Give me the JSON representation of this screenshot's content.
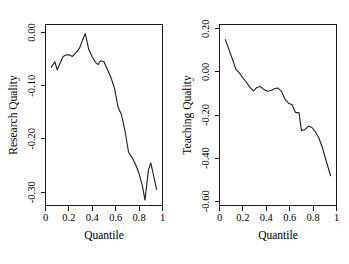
{
  "figure": {
    "background_color": "#ffffff",
    "line_color": "#1f1f1f",
    "axis_color": "#1a1a1a",
    "panel_count": 2
  },
  "chart_data": [
    {
      "type": "line",
      "panel_name": "research-quality",
      "title": "",
      "xlabel": "Quantile",
      "ylabel": "Research Quality",
      "xlim": [
        0,
        1
      ],
      "ylim": [
        -0.325,
        0.015
      ],
      "xticks": [
        0,
        0.2,
        0.4,
        0.6,
        0.8,
        1
      ],
      "xticklabels": [
        "0",
        "0.2",
        "0.4",
        "0.6",
        "0.8",
        "1"
      ],
      "yticks": [
        0.0,
        -0.1,
        -0.2,
        -0.3
      ],
      "yticklabels": [
        "0.00",
        "-0.10",
        "-0.20",
        "-0.30"
      ],
      "grid": false,
      "legend": "none",
      "x": [
        0.05,
        0.08,
        0.1,
        0.12,
        0.15,
        0.18,
        0.2,
        0.23,
        0.26,
        0.29,
        0.31,
        0.34,
        0.37,
        0.4,
        0.43,
        0.45,
        0.47,
        0.5,
        0.53,
        0.56,
        0.59,
        0.62,
        0.65,
        0.68,
        0.71,
        0.74,
        0.77,
        0.8,
        0.83,
        0.85,
        0.88,
        0.9,
        0.93,
        0.95
      ],
      "y": [
        -0.065,
        -0.055,
        -0.07,
        -0.06,
        -0.045,
        -0.042,
        -0.042,
        -0.045,
        -0.038,
        -0.03,
        -0.018,
        -0.002,
        -0.032,
        -0.046,
        -0.057,
        -0.06,
        -0.053,
        -0.055,
        -0.07,
        -0.085,
        -0.105,
        -0.14,
        -0.155,
        -0.185,
        -0.225,
        -0.235,
        -0.248,
        -0.265,
        -0.29,
        -0.315,
        -0.258,
        -0.245,
        -0.275,
        -0.295
      ]
    },
    {
      "type": "line",
      "panel_name": "teaching-quality",
      "title": "",
      "xlabel": "Quantile",
      "ylabel": "Teaching Quality",
      "xlim": [
        0,
        1
      ],
      "ylim": [
        -0.62,
        0.22
      ],
      "xticks": [
        0,
        0.2,
        0.4,
        0.6,
        0.8,
        1
      ],
      "xticklabels": [
        "0",
        "0.2",
        "0.4",
        "0.6",
        "0.8",
        "1"
      ],
      "yticks": [
        0.2,
        0.0,
        -0.2,
        -0.4,
        -0.6
      ],
      "yticklabels": [
        "0.20",
        "0.00",
        "-0.20",
        "-0.40",
        "-0.60"
      ],
      "grid": false,
      "legend": "none",
      "x": [
        0.05,
        0.08,
        0.11,
        0.14,
        0.17,
        0.2,
        0.23,
        0.26,
        0.29,
        0.32,
        0.35,
        0.38,
        0.41,
        0.44,
        0.47,
        0.5,
        0.53,
        0.56,
        0.59,
        0.62,
        0.65,
        0.68,
        0.7,
        0.73,
        0.76,
        0.79,
        0.82,
        0.85,
        0.88,
        0.91,
        0.95
      ],
      "y": [
        0.15,
        0.105,
        0.06,
        0.012,
        -0.005,
        -0.028,
        -0.048,
        -0.072,
        -0.088,
        -0.072,
        -0.068,
        -0.082,
        -0.09,
        -0.086,
        -0.078,
        -0.075,
        -0.09,
        -0.128,
        -0.145,
        -0.152,
        -0.188,
        -0.19,
        -0.272,
        -0.268,
        -0.252,
        -0.258,
        -0.278,
        -0.308,
        -0.352,
        -0.41,
        -0.482
      ]
    }
  ]
}
